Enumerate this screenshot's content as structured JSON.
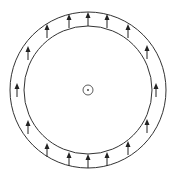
{
  "diagram": {
    "type": "concentric-rings-with-vector-field",
    "center": {
      "x": 88,
      "y": 90
    },
    "outer_radius": 78,
    "inner_radius": 64,
    "center_marker_radius": 5,
    "stroke_color": "#333333",
    "arrow_direction": "up",
    "arrows": [
      {
        "x": 69,
        "y": 21
      },
      {
        "x": 88,
        "y": 19
      },
      {
        "x": 107,
        "y": 21
      },
      {
        "x": 128,
        "y": 31
      },
      {
        "x": 147,
        "y": 52
      },
      {
        "x": 156,
        "y": 90
      },
      {
        "x": 147,
        "y": 126
      },
      {
        "x": 128,
        "y": 148
      },
      {
        "x": 107,
        "y": 159
      },
      {
        "x": 88,
        "y": 161
      },
      {
        "x": 69,
        "y": 159
      },
      {
        "x": 47,
        "y": 150
      },
      {
        "x": 28,
        "y": 127
      },
      {
        "x": 17,
        "y": 90
      },
      {
        "x": 28,
        "y": 53
      },
      {
        "x": 47,
        "y": 31
      }
    ]
  }
}
